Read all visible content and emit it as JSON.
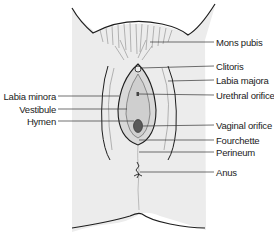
{
  "diagram": {
    "type": "anatomical-illustration",
    "labels_right": [
      {
        "text": "Mons pubis",
        "y": 42
      },
      {
        "text": "Clitoris",
        "y": 66
      },
      {
        "text": "Labia majora",
        "y": 80
      },
      {
        "text": "Urethral orifice",
        "y": 95
      },
      {
        "text": "Vaginal orifice",
        "y": 125
      },
      {
        "text": "Fourchette",
        "y": 140
      },
      {
        "text": "Perineum",
        "y": 152
      },
      {
        "text": "Anus",
        "y": 172
      }
    ],
    "labels_left": [
      {
        "text": "Labia minora",
        "y": 96
      },
      {
        "text": "Vestibule",
        "y": 109
      },
      {
        "text": "Hymen",
        "y": 121
      }
    ],
    "colors": {
      "skin": "#ececec",
      "outline": "#1e1e1e",
      "leader": "#333333",
      "orifice": "#555555"
    }
  }
}
